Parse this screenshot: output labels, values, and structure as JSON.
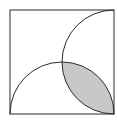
{
  "diagram": {
    "square": {
      "x": 10,
      "y": 10,
      "size": 104
    },
    "arcs": [
      {
        "name": "bottom-semicircle",
        "center": [
          62,
          114
        ],
        "radius": 52
      },
      {
        "name": "right-semicircle",
        "center": [
          114,
          62
        ],
        "radius": 52
      }
    ],
    "colors": {
      "stroke": "#2a2a2a",
      "shade": "#c8c8c8",
      "background": "#ffffff"
    }
  }
}
